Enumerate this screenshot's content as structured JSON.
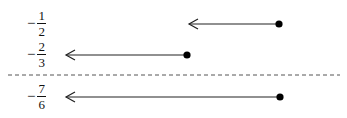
{
  "diagram": {
    "type": "number-line-rays",
    "rows": [
      {
        "sign": "−",
        "numerator": "1",
        "denominator": "2",
        "value": -0.5,
        "arrow": {
          "x_tip": 189,
          "x_dot": 279,
          "y": 24,
          "direction": "left",
          "endpoint": "closed"
        }
      },
      {
        "sign": "−",
        "numerator": "2",
        "denominator": "3",
        "value": -0.6667,
        "arrow": {
          "x_tip": 66,
          "x_dot": 187,
          "y": 55,
          "direction": "left",
          "endpoint": "closed"
        }
      },
      {
        "sign": "−",
        "numerator": "7",
        "denominator": "6",
        "value": -1.1667,
        "arrow": {
          "x_tip": 66,
          "x_dot": 280,
          "y": 97,
          "direction": "left",
          "endpoint": "closed"
        }
      }
    ],
    "separator": {
      "style": "dashed",
      "y": 75,
      "x_start": 8,
      "x_end": 340
    },
    "colors": {
      "stroke": "#222222",
      "dot": "#000000",
      "dash": "#555555"
    }
  }
}
